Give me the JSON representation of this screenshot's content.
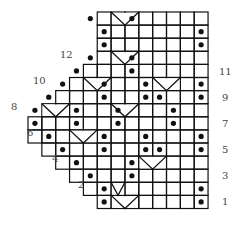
{
  "chart": {
    "columns": 13,
    "rows": 15,
    "right_row_labels": [
      "1",
      "3",
      "5",
      "7",
      "9",
      "11"
    ],
    "left_row_labels": [
      "2",
      "4",
      "6",
      "8",
      "10",
      "12"
    ],
    "row_start_col": [
      5,
      4,
      3,
      2,
      1,
      0,
      0,
      1,
      2,
      3,
      4,
      5,
      5,
      5,
      5
    ],
    "dots": [
      [
        5,
        1
      ],
      [
        12,
        1
      ],
      [
        5,
        2
      ],
      [
        12,
        2
      ],
      [
        4,
        3
      ],
      [
        7,
        3
      ],
      [
        3,
        4
      ],
      [
        7,
        4
      ],
      [
        2,
        5
      ],
      [
        5,
        5
      ],
      [
        8,
        5
      ],
      [
        9,
        5
      ],
      [
        12,
        5
      ],
      [
        1,
        6
      ],
      [
        5,
        6
      ],
      [
        8,
        6
      ],
      [
        12,
        6
      ],
      [
        0,
        7
      ],
      [
        3,
        7
      ],
      [
        6,
        7
      ],
      [
        10,
        7
      ],
      [
        0,
        8
      ],
      [
        3,
        8
      ],
      [
        6,
        8
      ],
      [
        10,
        8
      ],
      [
        1,
        9
      ],
      [
        5,
        9
      ],
      [
        8,
        9
      ],
      [
        9,
        9
      ],
      [
        12,
        9
      ],
      [
        2,
        10
      ],
      [
        5,
        10
      ],
      [
        8,
        10
      ],
      [
        12,
        10
      ],
      [
        3,
        11
      ],
      [
        7,
        11
      ],
      [
        4,
        12
      ],
      [
        7,
        12
      ],
      [
        5,
        13
      ],
      [
        12,
        13
      ],
      [
        5,
        14
      ],
      [
        12,
        14
      ],
      [
        4,
        15
      ],
      [
        7,
        15
      ]
    ],
    "decreases": [
      {
        "from": [
          6,
          1
        ],
        "to": [
          8,
          1
        ]
      },
      {
        "from": [
          6,
          2
        ],
        "to": [
          7,
          3
        ],
        "to2": [
          8,
          2
        ]
      },
      {
        "from": [
          3,
          6
        ],
        "to": [
          5,
          6
        ]
      },
      {
        "from": [
          8,
          4
        ],
        "to": [
          10,
          4
        ]
      },
      {
        "from": [
          1,
          8
        ],
        "to": [
          3,
          8
        ]
      },
      {
        "from": [
          6,
          8
        ],
        "to": [
          8,
          8
        ]
      },
      {
        "from": [
          4,
          10
        ],
        "to": [
          6,
          10
        ]
      },
      {
        "from": [
          9,
          10
        ],
        "to": [
          11,
          10
        ]
      },
      {
        "from": [
          6,
          12
        ],
        "to": [
          8,
          12
        ]
      },
      {
        "from": [
          6,
          15
        ],
        "to": [
          8,
          15
        ]
      }
    ]
  }
}
